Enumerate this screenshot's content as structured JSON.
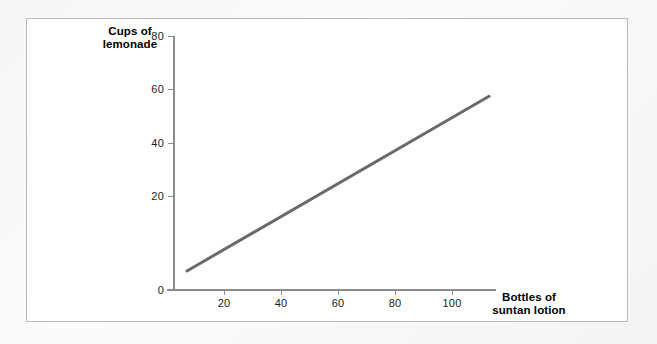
{
  "chart_data": {
    "type": "line",
    "title": "",
    "xlabel": "Bottles of suntan lotion",
    "ylabel": "Cups of lemonade",
    "xlim": [
      0,
      120
    ],
    "ylim": [
      0,
      90
    ],
    "grid": false,
    "legend": null,
    "xticks": [
      20,
      40,
      60,
      80,
      100
    ],
    "yticks": [
      0,
      20,
      40,
      60,
      80
    ],
    "xtick_labels": [
      "20",
      "40",
      "60",
      "80",
      "100"
    ],
    "ytick_labels": [
      "0",
      "20",
      "40",
      "60",
      "80"
    ],
    "series": [
      {
        "name": "lemonade-vs-lotion",
        "color": "#6a6a6a",
        "line_width": 3,
        "x": [
          7,
          113
        ],
        "y": [
          6,
          61
        ]
      }
    ]
  },
  "axes": {
    "y_title": "Cups of\nlemonade",
    "x_title": "Bottles of\nsuntan lotion",
    "y_tick_0": "0",
    "y_tick_20": "20",
    "y_tick_40": "40",
    "y_tick_60": "60",
    "y_tick_80": "80",
    "x_tick_20": "20",
    "x_tick_40": "40",
    "x_tick_60": "60",
    "x_tick_80": "80",
    "x_tick_100": "100"
  },
  "colors": {
    "series_line": "#6a6a6a",
    "axis": "#8c8c8c",
    "panel_background": "#ffffff",
    "panel_border": "#b9b9b9",
    "page_background": "#f4f4f4",
    "text": "#1c1c1c"
  }
}
